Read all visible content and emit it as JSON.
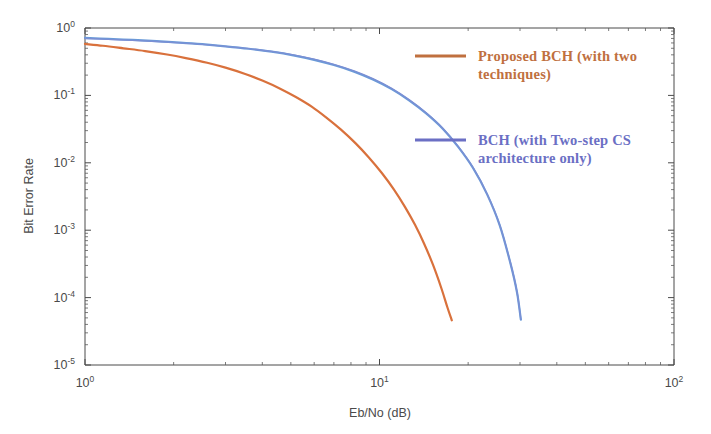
{
  "chart_data": {
    "type": "line",
    "title": "",
    "xlabel": "Eb/No (dB)",
    "ylabel": "Bit Error Rate",
    "xscale": "log",
    "yscale": "log",
    "xlim": [
      1,
      100
    ],
    "ylim": [
      1e-05,
      1
    ],
    "grid": false,
    "legend_position": "upper-right-inside",
    "xticklabels": [
      "10",
      "10",
      "10"
    ],
    "xtickexponents": [
      "0",
      "1",
      "2"
    ],
    "xtickvalues": [
      1,
      10,
      100
    ],
    "yticklabels": [
      "10",
      "10",
      "10",
      "10",
      "10",
      "10"
    ],
    "ytickexponents": [
      "0",
      "-1",
      "-2",
      "-3",
      "-4",
      "-5"
    ],
    "ytickvalues": [
      1,
      0.1,
      0.01,
      0.001,
      0.0001,
      1e-05
    ],
    "series": [
      {
        "name": "Proposed BCH (with two techniques)",
        "color": "#D9713C",
        "linewidth": 2.2,
        "x": [
          1.0,
          1.15,
          1.35,
          1.6,
          1.9,
          2.2,
          2.6,
          3.0,
          3.5,
          4.0,
          4.6,
          5.2,
          5.9,
          6.6,
          7.4,
          8.3,
          9.2,
          10.2,
          11.2,
          12.2,
          13.2,
          14.2,
          15.2,
          16.2,
          17.0,
          17.6
        ],
        "y": [
          0.58,
          0.545,
          0.5,
          0.455,
          0.405,
          0.358,
          0.305,
          0.258,
          0.208,
          0.166,
          0.126,
          0.0945,
          0.0675,
          0.0468,
          0.031,
          0.0194,
          0.012,
          0.007,
          0.004,
          0.00222,
          0.0012,
          0.00062,
          0.000305,
          0.00014,
          7.2e-05,
          4.6e-05
        ]
      },
      {
        "name": "BCH (with Two-step CS architecture only)",
        "color": "#6A9BD8",
        "linewidth": 2.2,
        "x": [
          1.0,
          1.2,
          1.45,
          1.75,
          2.1,
          2.5,
          3.0,
          3.6,
          4.3,
          5.1,
          6.0,
          7.0,
          8.2,
          9.5,
          11.0,
          12.6,
          14.4,
          16.4,
          18.5,
          20.8,
          23.2,
          25.6,
          27.8,
          29.3,
          30.2
        ],
        "y": [
          0.715,
          0.69,
          0.665,
          0.638,
          0.608,
          0.575,
          0.535,
          0.492,
          0.445,
          0.393,
          0.337,
          0.282,
          0.225,
          0.172,
          0.124,
          0.0845,
          0.054,
          0.032,
          0.0172,
          0.0083,
          0.0034,
          0.00118,
          0.00033,
          0.00012,
          4.7e-05
        ]
      },
      {
        "name": "BCH (with Two-step CS architecture only) - overlay",
        "color": "#7B8FD4",
        "linewidth": 1.4,
        "x": [
          1.0,
          1.2,
          1.45,
          1.75,
          2.1,
          2.5,
          3.0,
          3.6,
          4.3,
          5.1,
          6.0,
          7.0,
          8.2,
          9.5,
          11.0,
          12.6,
          14.4,
          16.4,
          18.5,
          20.8,
          23.2,
          25.6,
          27.8,
          29.3,
          30.2
        ],
        "y": [
          0.7,
          0.678,
          0.655,
          0.63,
          0.602,
          0.572,
          0.534,
          0.494,
          0.45,
          0.4,
          0.345,
          0.289,
          0.231,
          0.177,
          0.127,
          0.0865,
          0.0552,
          0.0326,
          0.0175,
          0.00845,
          0.00345,
          0.0012,
          0.000335,
          0.000122,
          4.75e-05
        ]
      }
    ]
  },
  "legend": {
    "entries": [
      {
        "label_line1": "Proposed BCH (with two",
        "label_line2": "techniques)",
        "color": "#C0703F"
      },
      {
        "label_line1": "BCH (with Two-step CS",
        "label_line2": "architecture only)",
        "color": "#6B6FC4"
      }
    ]
  }
}
